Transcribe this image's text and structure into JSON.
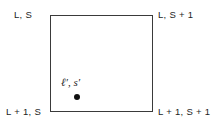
{
  "figure": {
    "background_color": "#ffffff",
    "line_color": "#3a3a3a",
    "text_color": "#1d1d1d",
    "dot_color": "#111111",
    "width": 219,
    "height": 129
  },
  "cell": {
    "corners": {
      "top_left": "L, S",
      "top_right": "L, S + 1",
      "bottom_left": "L + 1, S",
      "bottom_right": "L + 1, S + 1"
    }
  },
  "interior_point": {
    "label": "ℓ′, s′",
    "dot_marker": "filled-circle"
  }
}
